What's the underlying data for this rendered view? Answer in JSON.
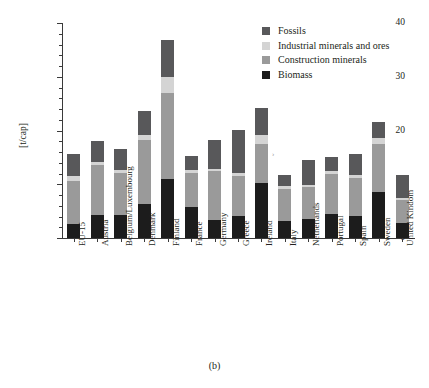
{
  "caption": "(b)",
  "chart_data": {
    "type": "bar",
    "subtype": "stacked-vertical",
    "title": "",
    "xlabel": "",
    "ylabel": "[t/cap]",
    "ylim": [
      0,
      40
    ],
    "yticks": [
      0,
      10,
      20,
      30,
      40
    ],
    "ytick_labels": [
      "0",
      "10",
      "20",
      "30",
      "40"
    ],
    "minor_tick_step": 2,
    "grid": false,
    "legend_position": "top-right",
    "categories": [
      "EU-15",
      "Austria",
      "Belgium/Luxembourg",
      "Denmark",
      "Finland",
      "France",
      "Germany",
      "Greece",
      "Ireland",
      "Italy",
      "Netherlands",
      "Portugal",
      "Spain",
      "Sweden",
      "United Kindom"
    ],
    "series": [
      {
        "name": "Biomass",
        "color": "#1c1c1c",
        "values": [
          2.6,
          4.2,
          4.3,
          6.4,
          10.9,
          5.7,
          3.4,
          4.1,
          10.3,
          3.1,
          3.6,
          4.4,
          4.1,
          8.5,
          2.7
        ]
      },
      {
        "name": "Construction minerals",
        "color": "#9a9a9a",
        "values": [
          8.0,
          9.4,
          7.7,
          11.9,
          16.1,
          6.4,
          9.0,
          7.4,
          7.1,
          6.1,
          5.8,
          7.6,
          7.1,
          8.9,
          4.4
        ]
      },
      {
        "name": "Industrial minerals and ores",
        "color": "#d4d4d4",
        "values": [
          0.9,
          0.5,
          0.7,
          0.8,
          2.9,
          0.5,
          0.5,
          0.6,
          1.7,
          0.4,
          0.5,
          0.5,
          0.5,
          1.2,
          0.4
        ]
      },
      {
        "name": "Fossils",
        "color": "#58585a",
        "values": [
          4.2,
          4.0,
          3.9,
          4.5,
          7.0,
          2.6,
          5.3,
          8.0,
          5.1,
          2.1,
          4.6,
          2.6,
          3.9,
          3.0,
          4.3
        ]
      }
    ],
    "totals": [
      15.7,
      18.1,
      16.6,
      23.6,
      36.9,
      15.2,
      18.2,
      20.1,
      24.2,
      11.7,
      14.5,
      15.1,
      15.6,
      21.6,
      11.8
    ],
    "units": "t/cap"
  },
  "legend": {
    "items": [
      {
        "label": "Fossils",
        "color": "#58585a"
      },
      {
        "label": "Industrial minerals and ores",
        "color": "#d4d4d4"
      },
      {
        "label": "Construction minerals",
        "color": "#9a9a9a"
      },
      {
        "label": "Biomass",
        "color": "#1c1c1c"
      }
    ]
  }
}
